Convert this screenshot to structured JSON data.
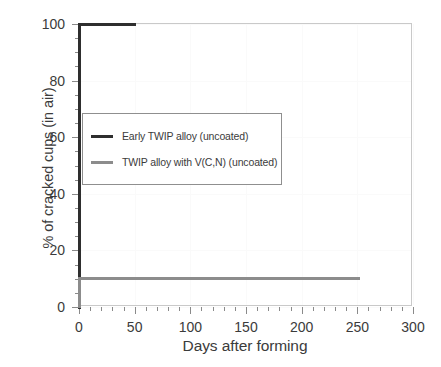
{
  "chart_data": {
    "type": "line",
    "title": "",
    "xlabel": "Days after forming",
    "ylabel": "% of cracked cups (in air)",
    "xlim": [
      0,
      300
    ],
    "ylim": [
      0,
      100
    ],
    "xticks": [
      0,
      50,
      100,
      150,
      200,
      250,
      300
    ],
    "yticks": [
      0,
      20,
      40,
      60,
      80,
      100
    ],
    "xticklabels": [
      "0",
      "50",
      "100",
      "150",
      "200",
      "250",
      "300"
    ],
    "yticklabels": [
      "0",
      "20",
      "40",
      "60",
      "80",
      "100"
    ],
    "x_minor_interval": 10,
    "y_minor_interval": 5,
    "grid": true,
    "legend_position": "center-left",
    "series": [
      {
        "name": "Early TWIP alloy (uncoated)",
        "color": "#2e2e2e",
        "step": "post",
        "x": [
          0,
          1,
          51
        ],
        "y": [
          0,
          100,
          100
        ]
      },
      {
        "name": "TWIP alloy with V(C,N) (uncoated)",
        "color": "#8c8c8c",
        "step": "post",
        "x": [
          0,
          245,
          252
        ],
        "y": [
          0,
          10,
          10
        ]
      }
    ]
  },
  "legend": {
    "entries": [
      {
        "label": "Early TWIP alloy (uncoated)",
        "color": "#2e2e2e"
      },
      {
        "label": "TWIP alloy with V(C,N) (uncoated)",
        "color": "#8c8c8c"
      }
    ]
  },
  "axes": {
    "x_title": "Days after forming",
    "y_title": "% of cracked cups (in air)"
  },
  "colors": {
    "frame": "#c9c9c9",
    "tick": "#8a8a8a",
    "text": "#3b3b3b",
    "grid": "#fafafa",
    "background": "#ffffff",
    "legend_border": "#8f8f8f"
  }
}
